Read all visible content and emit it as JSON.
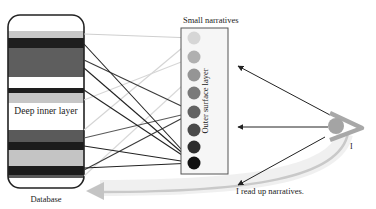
{
  "labels": {
    "database": "Database",
    "deep_inner_layer": "Deep inner layer",
    "small_narratives": "Small narratives",
    "outer_surface_layer": "Outer surface layer",
    "observer": "I",
    "caption": "I read up narratives."
  },
  "database": {
    "stripes": [
      {
        "y": 31,
        "h": 7,
        "color": "#c8c8c8"
      },
      {
        "y": 38,
        "h": 10,
        "color": "#1e1e1e"
      },
      {
        "y": 48,
        "h": 29,
        "color": "#5e5e5e"
      },
      {
        "y": 77,
        "h": 11,
        "color": "#ffffff"
      },
      {
        "y": 88,
        "h": 5,
        "color": "#1e1e1e"
      },
      {
        "y": 93,
        "h": 10,
        "color": "#c6c6c6"
      },
      {
        "y": 103,
        "h": 27,
        "color": "#ffffff"
      },
      {
        "y": 130,
        "h": 12,
        "color": "#5a5a5a"
      },
      {
        "y": 142,
        "h": 8,
        "color": "#1c1c1c"
      },
      {
        "y": 150,
        "h": 16,
        "color": "#c4c4c4"
      },
      {
        "y": 166,
        "h": 9,
        "color": "#1c1c1c"
      },
      {
        "y": 175,
        "h": 3,
        "color": "#5a5a5a"
      }
    ]
  },
  "narratives": {
    "circles": [
      {
        "cy": 38,
        "color": "#d6d6d6"
      },
      {
        "cy": 57,
        "color": "#b0b0b0"
      },
      {
        "cy": 75,
        "color": "#959595"
      },
      {
        "cy": 93,
        "color": "#7a7a7a"
      },
      {
        "cy": 112,
        "color": "#626262"
      },
      {
        "cy": 130,
        "color": "#4a4a4a"
      },
      {
        "cy": 147,
        "color": "#2e2e2e"
      },
      {
        "cy": 163,
        "color": "#111111"
      }
    ]
  },
  "connections": [
    {
      "from_y": 34,
      "to": 0,
      "color": "#cfcfcf"
    },
    {
      "from_y": 130,
      "to": 0,
      "color": "#d4d4d4"
    },
    {
      "from_y": 100,
      "to": 1,
      "color": "#d6d6d6"
    },
    {
      "from_y": 176,
      "to": 2,
      "color": "#d8d8d8"
    },
    {
      "from_y": 60,
      "to": 4,
      "color": "#3a3a3a"
    },
    {
      "from_y": 138,
      "to": 4,
      "color": "#5a5a5a"
    },
    {
      "from_y": 170,
      "to": 4,
      "color": "#3a3a3a"
    },
    {
      "from_y": 44,
      "to": 7,
      "color": "#222222"
    },
    {
      "from_y": 68,
      "to": 7,
      "color": "#222222"
    },
    {
      "from_y": 90,
      "to": 7,
      "color": "#222222"
    },
    {
      "from_y": 146,
      "to": 7,
      "color": "#222222"
    },
    {
      "from_y": 168,
      "to": 7,
      "color": "#222222"
    }
  ],
  "arrows": [
    {
      "from": [
        330,
        115
      ],
      "to": [
        238,
        66
      ]
    },
    {
      "from": [
        328,
        127
      ],
      "to": [
        238,
        127
      ]
    },
    {
      "from": [
        325,
        137
      ],
      "to": [
        238,
        185
      ]
    }
  ],
  "colors": {
    "line": "#222222",
    "box_border": "#555555",
    "box_fill": "#f6f6f6",
    "eye": "#a8a8a8",
    "big_arrow": "#d0d0d0"
  }
}
